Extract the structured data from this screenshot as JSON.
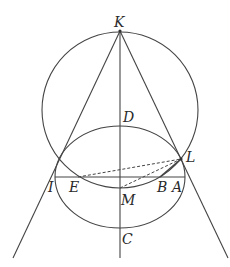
{
  "diagram": {
    "type": "geometry-construction",
    "colors": {
      "line": "#444444",
      "text": "#2a2a2a",
      "background": "#ffffff"
    },
    "points": {
      "K": {
        "label": "K",
        "x": 120,
        "y": 31
      },
      "D": {
        "label": "D",
        "x": 120,
        "y": 126
      },
      "L": {
        "label": "L",
        "x": 181,
        "y": 159
      },
      "I": {
        "label": "I",
        "x": 55,
        "y": 177
      },
      "E": {
        "label": "E",
        "x": 78,
        "y": 177
      },
      "B": {
        "label": "B",
        "x": 160,
        "y": 177
      },
      "A": {
        "label": "A",
        "x": 183,
        "y": 177
      },
      "M": {
        "label": "M",
        "x": 120,
        "y": 188
      },
      "C": {
        "label": "C",
        "x": 120,
        "y": 228
      }
    },
    "shapes": [
      {
        "kind": "circle",
        "name": "large-circle",
        "cx": 120,
        "cy": 110,
        "r": 78
      },
      {
        "kind": "ellipse",
        "name": "ellipse",
        "cx": 120,
        "cy": 177,
        "rx": 65,
        "ry": 51
      },
      {
        "kind": "line",
        "name": "axis-KC",
        "from": "K",
        "to": [
          120,
          258
        ]
      },
      {
        "kind": "line",
        "name": "line-K-left",
        "from": "K",
        "to": [
          13,
          258
        ]
      },
      {
        "kind": "line",
        "name": "line-K-right",
        "from": "K",
        "to": [
          228,
          258
        ]
      },
      {
        "kind": "line",
        "name": "chord-IA",
        "from": "I",
        "to": "A"
      },
      {
        "kind": "segment",
        "name": "segment-BL",
        "from": "B",
        "to": "L"
      },
      {
        "kind": "dashed",
        "name": "dashed-EL",
        "from": "E",
        "to": "L"
      },
      {
        "kind": "dashed",
        "name": "dashed-ML",
        "from": "M",
        "to": "L"
      }
    ]
  }
}
